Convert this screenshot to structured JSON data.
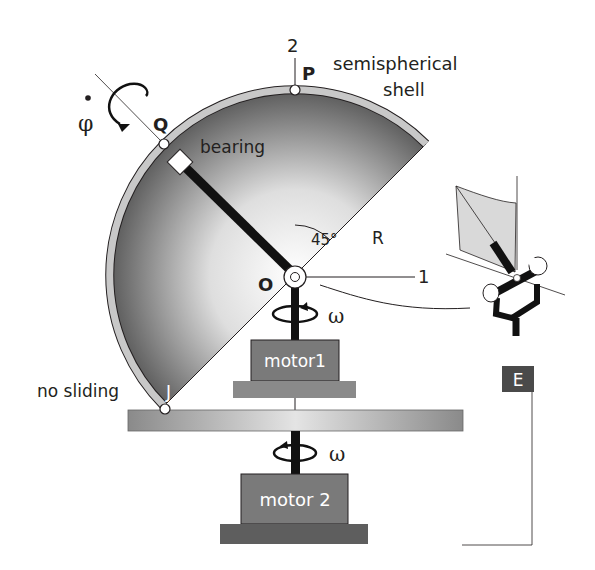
{
  "diagram": {
    "labels": {
      "axis_2": "2",
      "axis_1": "1",
      "point_P": "P",
      "point_Q": "Q",
      "point_O": "O",
      "point_J": "J",
      "shell": "semispherical",
      "shell_line2": "shell",
      "bearing": "bearing",
      "angle": "45°",
      "radius": "R",
      "omega_1": "ω",
      "omega_2": "ω",
      "phi_dot": "φ",
      "phi_dot_mark": "•",
      "no_sliding": "no sliding",
      "motor1": "motor1",
      "motor2": "motor 2",
      "frame_E": "E"
    },
    "colors": {
      "shell_rim": "#c8c8c8",
      "shell_dark": "#6e6e6e",
      "motor_fill": "#7a7a7a",
      "base_fill": "#5e5e5e",
      "platform_fill": "#a8a8a8",
      "line": "#231f20",
      "detail_fill": "#d9d9d9"
    }
  }
}
